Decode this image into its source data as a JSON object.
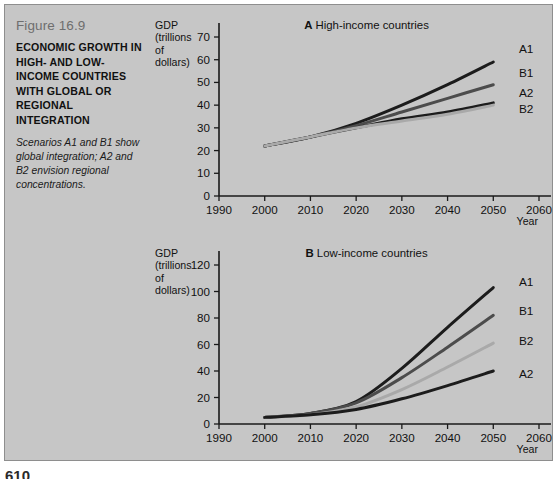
{
  "figure": {
    "number": "Figure 16.9",
    "title": "ECONOMIC GROWTH IN HIGH- AND LOW-INCOME COUNTRIES WITH GLOBAL OR REGIONAL INTEGRATION",
    "description": "Scenarios A1 and B1 show global integration; A2 and B2 envision regional concentrations.",
    "page_number": "610",
    "background_color": "#c6c6c6",
    "border_color": "#8e8e8e"
  },
  "series_colors": {
    "A1": "#1c1c1c",
    "B1": "#4c4c4c",
    "B2": "#a9a9a9",
    "A2": "#1c1c1c"
  },
  "chart_data": [
    {
      "id": "A",
      "type": "line",
      "title": "A High-income countries",
      "panel_letter": "A",
      "panel_name": "High-income countries",
      "xlabel": "Year",
      "ylabel": "GDP (trillions of dollars)",
      "ylabel_lines": [
        "GDP",
        "(trillions",
        "of",
        "dollars)"
      ],
      "xlim": [
        1990,
        2060
      ],
      "ylim": [
        0,
        70
      ],
      "xticks": [
        1990,
        2000,
        2010,
        2020,
        2030,
        2040,
        2050,
        2060
      ],
      "yticks": [
        0,
        10,
        20,
        30,
        40,
        50,
        60,
        70
      ],
      "grid": false,
      "legend": "line-end labels",
      "x": [
        2000,
        2010,
        2020,
        2030,
        2040,
        2050
      ],
      "series": [
        {
          "name": "A1",
          "values": [
            22,
            26,
            32,
            40,
            49,
            59
          ]
        },
        {
          "name": "B1",
          "values": [
            22,
            26,
            31,
            37,
            43,
            49
          ]
        },
        {
          "name": "A2",
          "values": [
            22,
            26,
            30,
            34,
            37,
            41
          ]
        },
        {
          "name": "B2",
          "values": [
            22,
            26,
            30,
            33,
            36,
            40
          ]
        }
      ]
    },
    {
      "id": "B",
      "type": "line",
      "title": "B Low-income countries",
      "panel_letter": "B",
      "panel_name": "Low-income countries",
      "xlabel": "Year",
      "ylabel": "GDP (trillions of dollars)",
      "ylabel_lines": [
        "GDP",
        "(trillions",
        "of",
        "dollars)"
      ],
      "xlim": [
        1990,
        2060
      ],
      "ylim": [
        0,
        120
      ],
      "xticks": [
        1990,
        2000,
        2010,
        2020,
        2030,
        2040,
        2050,
        2060
      ],
      "yticks": [
        0,
        20,
        40,
        60,
        80,
        100,
        120
      ],
      "grid": false,
      "legend": "line-end labels",
      "x": [
        2000,
        2010,
        2020,
        2030,
        2040,
        2050
      ],
      "series": [
        {
          "name": "A1",
          "values": [
            5,
            8,
            17,
            42,
            73,
            103
          ]
        },
        {
          "name": "B1",
          "values": [
            5,
            8,
            16,
            35,
            58,
            82
          ]
        },
        {
          "name": "B2",
          "values": [
            5,
            7,
            13,
            26,
            43,
            61
          ]
        },
        {
          "name": "A2",
          "values": [
            5,
            7,
            11,
            19,
            29,
            40
          ]
        }
      ]
    }
  ]
}
